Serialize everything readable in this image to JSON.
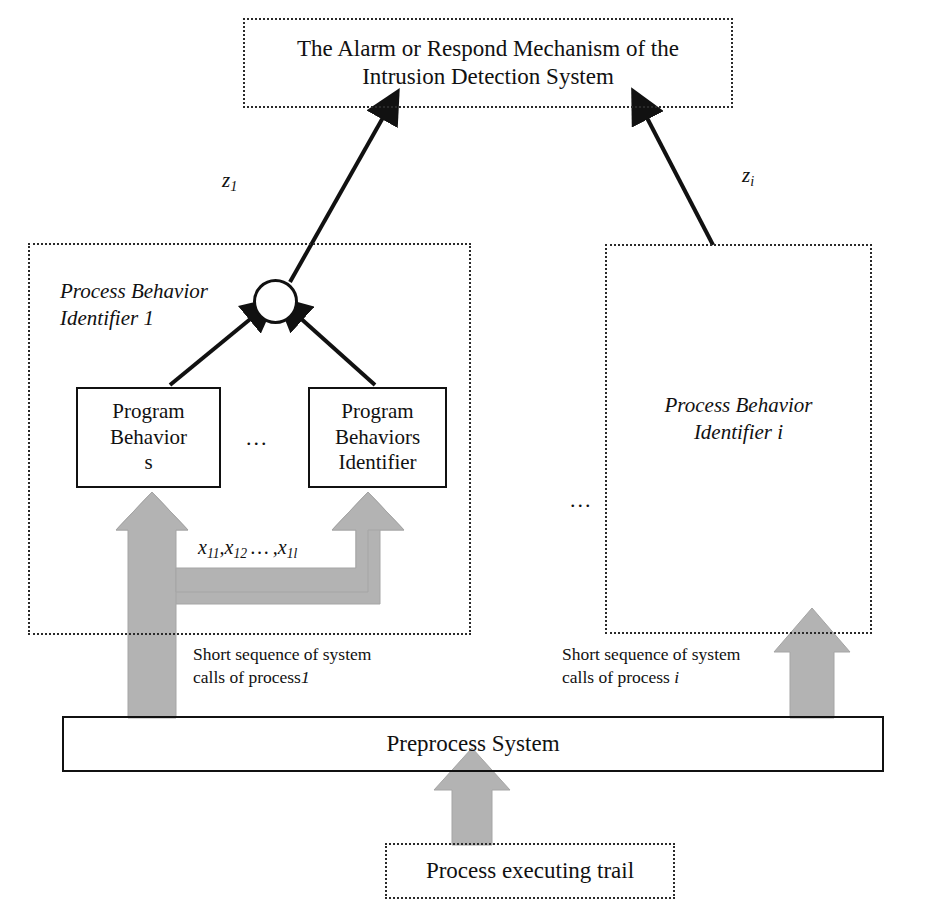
{
  "diagram": {
    "title_box": {
      "line1": "The Alarm or Respond Mechanism of the",
      "line2": "Intrusion Detection System",
      "border": "dotted"
    },
    "left_panel": {
      "label_line1": "Process Behavior",
      "label_line2": "Identifier  1",
      "border": "dotted",
      "program_box_left": {
        "line1": "Program",
        "line2": "Behavior",
        "line3": "s"
      },
      "program_box_right": {
        "line1": "Program",
        "line2": "Behaviors",
        "line3": "Identifier"
      },
      "ellipsis": "...",
      "feature_vector": "x11, x12, ... , x1l",
      "feature_vector_parts": {
        "v1_base": "x",
        "v1_sub": "11",
        "comma1": ",",
        "v2_base": "x",
        "v2_sub": "12",
        "mid_dots": "…",
        "comma2": ",",
        "v3_base": "x",
        "v3_sub": "1l"
      },
      "input_caption_line1": "Short sequence of system",
      "input_caption_line2": "calls of process",
      "input_caption_index": "1",
      "output_label_base": "z",
      "output_label_sub": "1"
    },
    "right_panel": {
      "label_line1": "Process Behavior",
      "label_line2": "Identifier i",
      "border": "dotted",
      "ellipsis": "...",
      "input_caption_line1": "Short sequence of system",
      "input_caption_line2": "calls of process",
      "input_caption_index": "i",
      "output_label_base": "z",
      "output_label_sub": "i"
    },
    "preprocess_box": {
      "label": "Preprocess System",
      "border": "solid"
    },
    "trail_box": {
      "label": "Process executing trail",
      "border": "dotted"
    },
    "colors": {
      "stroke": "#111111",
      "dotted_stroke": "#2a2a2a",
      "gray_arrow_fill": "#b3b3b3",
      "gray_arrow_stroke": "#9a9a9a",
      "background": "#ffffff"
    }
  }
}
